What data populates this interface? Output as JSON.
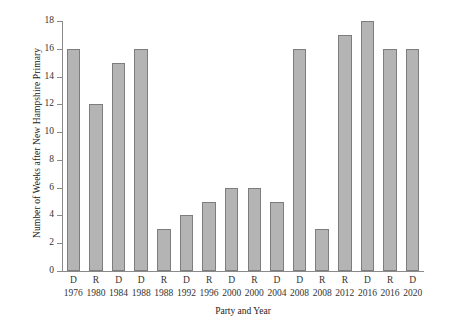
{
  "chart_data": {
    "type": "bar",
    "title": "",
    "xlabel": "Party and Year",
    "ylabel": "Number of Weeks after New Hampshire Primary",
    "categories": [
      "D 1976",
      "R 1980",
      "D 1984",
      "D 1988",
      "R 1988",
      "D 1992",
      "R 1996",
      "D 2000",
      "R 2000",
      "D 2004",
      "D 2008",
      "R 2008",
      "R 2012",
      "D 2016",
      "R 2016",
      "D 2020"
    ],
    "parties": [
      "D",
      "R",
      "D",
      "D",
      "R",
      "D",
      "R",
      "D",
      "R",
      "D",
      "D",
      "R",
      "R",
      "D",
      "R",
      "D"
    ],
    "years": [
      "1976",
      "1980",
      "1984",
      "1988",
      "1988",
      "1992",
      "1996",
      "2000",
      "2000",
      "2004",
      "2008",
      "2008",
      "2012",
      "2016",
      "2016",
      "2020"
    ],
    "values": [
      16,
      12,
      15,
      16,
      3,
      4,
      5,
      6,
      6,
      5,
      16,
      3,
      17,
      18,
      16,
      16
    ],
    "ylim": [
      0,
      18
    ],
    "yticks": [
      0,
      2,
      4,
      6,
      8,
      10,
      12,
      14,
      16,
      18
    ],
    "ytick_labels": [
      "0",
      "2",
      "4",
      "6",
      "8",
      "10",
      "12",
      "14",
      "16",
      "18"
    ],
    "grid": false,
    "legend": null,
    "bar_color": "#b4b4b4",
    "bar_edge_color": "#7d7d7d",
    "axis_color": "#8a8a8a",
    "background": "#ffffff"
  }
}
